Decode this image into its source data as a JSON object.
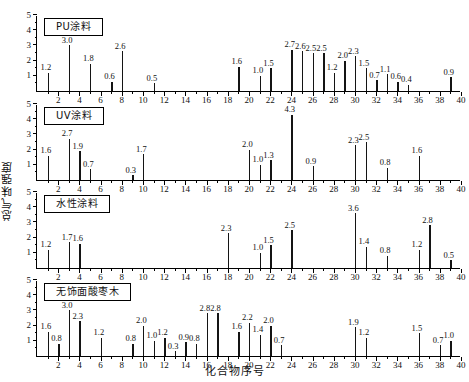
{
  "chart_data": {
    "type": "bar",
    "title": "",
    "xlabel": "化合物序号",
    "ylabel": "总气味强度",
    "xlim": [
      0,
      40
    ],
    "ylim": [
      0,
      5
    ],
    "xticks": [
      2,
      4,
      6,
      8,
      10,
      12,
      14,
      16,
      18,
      20,
      22,
      24,
      26,
      28,
      30,
      32,
      34,
      36,
      38,
      40
    ],
    "yticks": [
      1,
      2,
      3,
      4,
      5
    ],
    "grid": false,
    "legend": "none",
    "panels": [
      {
        "label": "PU涂料",
        "x": [
          1,
          3,
          5,
          7,
          8,
          11,
          19,
          21,
          22,
          24,
          25,
          26,
          27,
          28,
          29,
          30,
          31,
          32,
          33,
          34,
          35,
          39
        ],
        "values": [
          1.2,
          3.0,
          1.8,
          0.6,
          2.6,
          0.5,
          1.6,
          1.0,
          1.5,
          2.7,
          2.6,
          2.5,
          2.5,
          1.2,
          2.0,
          2.3,
          1.5,
          0.7,
          1.1,
          0.6,
          0.4,
          0.9
        ]
      },
      {
        "label": "UV涂料",
        "x": [
          1,
          3,
          4,
          5,
          9,
          10,
          20,
          21,
          22,
          24,
          26,
          30,
          31,
          33,
          36
        ],
        "values": [
          1.6,
          2.7,
          1.9,
          0.7,
          0.3,
          1.7,
          2.0,
          1.0,
          1.3,
          4.3,
          0.9,
          2.3,
          2.5,
          0.8,
          1.6
        ]
      },
      {
        "label": "水性涂料",
        "x": [
          1,
          3,
          4,
          18,
          21,
          22,
          24,
          30,
          31,
          33,
          36,
          37,
          39
        ],
        "values": [
          1.2,
          1.7,
          1.6,
          2.3,
          1.0,
          1.5,
          2.5,
          3.6,
          1.4,
          0.8,
          1.2,
          2.8,
          0.5
        ]
      },
      {
        "label": "无饰面酸枣木",
        "x": [
          1,
          2,
          3,
          4,
          6,
          9,
          10,
          11,
          12,
          13,
          14,
          15,
          16,
          17,
          19,
          20,
          21,
          22,
          23,
          30,
          31,
          36,
          38,
          39
        ],
        "values": [
          1.6,
          0.8,
          3.0,
          2.3,
          1.2,
          0.8,
          2.0,
          1.0,
          1.2,
          0.3,
          0.9,
          0.8,
          2.8,
          2.8,
          1.6,
          2.2,
          1.4,
          2.0,
          0.7,
          1.9,
          1.2,
          1.5,
          0.7,
          1.0
        ]
      }
    ]
  },
  "colors": {
    "stem": "#141414",
    "axis": "#000000",
    "background": "#ffffff"
  }
}
